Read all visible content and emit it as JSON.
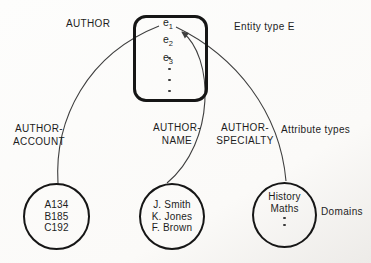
{
  "colors": {
    "background": "#fbfaf8",
    "ink": "#1d1d1d",
    "line": "#3f3f3f",
    "border": "#161616"
  },
  "header": {
    "author_label": "AUTHOR",
    "entity_type_label": "Entity type E"
  },
  "entity_box": {
    "entities": [
      {
        "base": "e",
        "sub": "1"
      },
      {
        "base": "e",
        "sub": "2"
      },
      {
        "base": "e",
        "sub": "3"
      }
    ]
  },
  "annotations": {
    "attribute_types_label": "Attribute types",
    "domains_label": "Domains"
  },
  "attributes": [
    {
      "line1": "AUTHOR-",
      "line2": "ACCOUNT"
    },
    {
      "line1": "AUTHOR-",
      "line2": "NAME"
    },
    {
      "line1": "AUTHOR-",
      "line2": "SPECIALTY"
    }
  ],
  "domains": [
    {
      "values": [
        "A134",
        "B185",
        "C192"
      ]
    },
    {
      "values": [
        "J. Smith",
        "K. Jones",
        "F. Brown"
      ]
    },
    {
      "values": [
        "History",
        "Maths"
      ]
    }
  ]
}
